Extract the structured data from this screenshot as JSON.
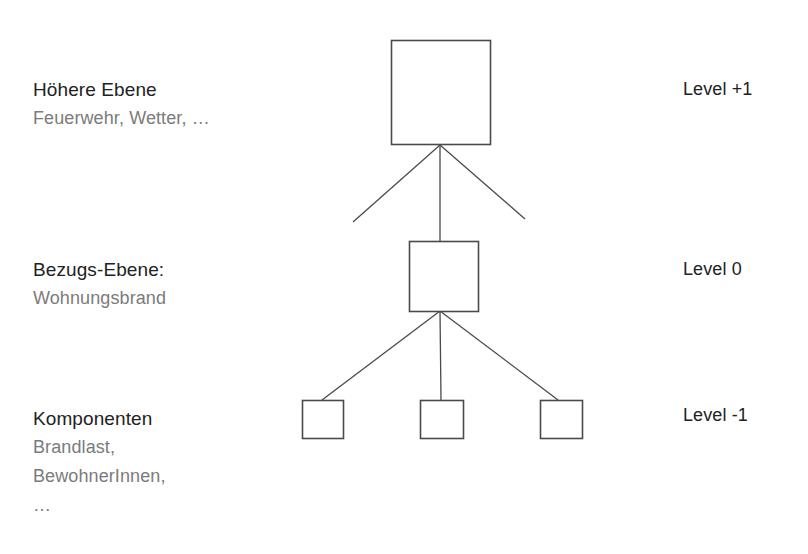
{
  "diagram": {
    "background_color": "#ffffff",
    "box_stroke_color": "#4a4a4a",
    "line_color": "#4a4a4a",
    "heading_color": "#222222",
    "subtext_color": "#7b7b7b",
    "rows": [
      {
        "id": "upper",
        "heading": "Höhere Ebene",
        "subtitle_lines": [
          "Feuerwehr, Wetter, …"
        ],
        "level_label": "Level +1",
        "node_count": 1
      },
      {
        "id": "reference",
        "heading": "Bezugs-Ebene:",
        "subtitle_lines": [
          "Wohnungsbrand"
        ],
        "level_label": "Level 0",
        "node_count": 1
      },
      {
        "id": "components",
        "heading": "Komponenten",
        "subtitle_lines": [
          "Brandlast,",
          "BewohnerInnen,",
          "…"
        ],
        "level_label": "Level -1",
        "node_count": 3
      }
    ]
  }
}
